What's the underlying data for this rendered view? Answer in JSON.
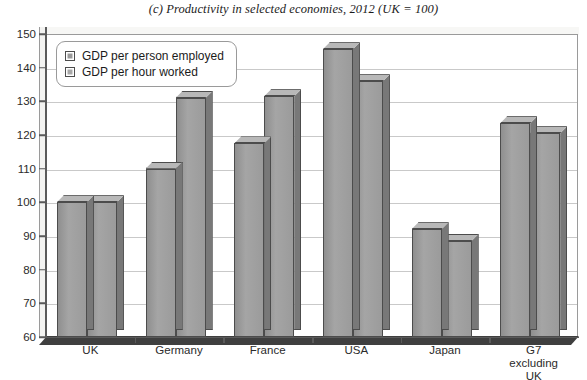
{
  "chart_data": {
    "type": "bar",
    "title": "(c) Productivity in selected economies, 2012 (UK = 100)",
    "xlabel": "",
    "ylabel": "",
    "ylim": [
      60,
      150
    ],
    "ytick_step": 10,
    "yticks": [
      150,
      140,
      130,
      120,
      110,
      100,
      90,
      80,
      70,
      60
    ],
    "grid": true,
    "legend_position": "top-left",
    "categories": [
      "UK",
      "Germany",
      "France",
      "USA",
      "Japan",
      "G7\nexcluding\nUK"
    ],
    "series": [
      {
        "name": "GDP per person employed",
        "values": [
          100,
          110,
          117.5,
          145.5,
          92,
          123.5
        ]
      },
      {
        "name": "GDP per hour worked",
        "values": [
          100,
          131,
          131.5,
          136,
          88.5,
          120.5
        ]
      }
    ]
  },
  "legend": {
    "items": [
      {
        "label": "GDP per person employed"
      },
      {
        "label": "GDP per hour worked"
      }
    ]
  }
}
